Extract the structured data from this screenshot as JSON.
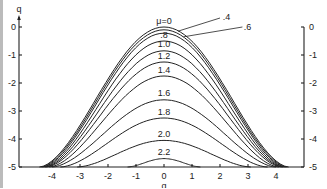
{
  "chart_data": {
    "type": "line",
    "title": "",
    "xlabel": "q",
    "ylabel": "q",
    "xlim": [
      -4.5,
      5
    ],
    "ylim": [
      -5,
      0.3
    ],
    "grid": false,
    "legend_position": "inline labels at curve peaks",
    "x_ticks": [
      "-4",
      "-3",
      "-2",
      "-1",
      "0",
      "1",
      "2",
      "3",
      "4"
    ],
    "y_ticks_left": [
      "0",
      "-1",
      "-2",
      "-3",
      "-4",
      "-5"
    ],
    "y_ticks_right": [
      "0",
      "-1",
      "-2",
      "-3",
      "-4",
      "-5"
    ],
    "series": [
      {
        "name": "μ=0",
        "label": "μ=0",
        "peak": [
          0,
          0.0
        ],
        "x_at_bottom": [
          -4.45,
          4.45
        ]
      },
      {
        "name": "0.4",
        "label": ".4",
        "peak": [
          0,
          -0.1
        ],
        "x_at_bottom": [
          -4.4,
          4.4
        ]
      },
      {
        "name": "0.6",
        "label": ".6",
        "peak": [
          0,
          -0.22
        ],
        "x_at_bottom": [
          -4.35,
          4.35
        ]
      },
      {
        "name": "0.8",
        "label": ".8",
        "peak": [
          0,
          -0.5
        ],
        "x_at_bottom": [
          -4.3,
          4.3
        ]
      },
      {
        "name": "1.0",
        "label": "1.0",
        "peak": [
          0,
          -0.85
        ],
        "x_at_bottom": [
          -4.25,
          4.25
        ]
      },
      {
        "name": "1.2",
        "label": "1.2",
        "peak": [
          0,
          -1.25
        ],
        "x_at_bottom": [
          -4.2,
          4.2
        ]
      },
      {
        "name": "1.4",
        "label": "1.4",
        "peak": [
          0,
          -1.75
        ],
        "x_at_bottom": [
          -4.1,
          4.1
        ]
      },
      {
        "name": "1.6",
        "label": "1.6",
        "peak": [
          0,
          -2.6
        ],
        "x_at_bottom": [
          -4.0,
          4.0
        ]
      },
      {
        "name": "1.8",
        "label": "1.8",
        "peak": [
          0,
          -3.25
        ],
        "x_at_bottom": [
          -3.7,
          3.7
        ]
      },
      {
        "name": "2.0",
        "label": "2.0",
        "peak": [
          0,
          -4.05
        ],
        "x_at_bottom": [
          -3.1,
          3.1
        ]
      },
      {
        "name": "2.2",
        "label": "2.2",
        "peak": [
          0,
          -4.7
        ],
        "x_at_bottom": [
          -1.3,
          1.3
        ]
      }
    ]
  },
  "axes": {
    "y_label_top": "q",
    "x_label_bottom": "q"
  },
  "colors": {
    "ink": "#222222",
    "background": "#ffffff"
  }
}
